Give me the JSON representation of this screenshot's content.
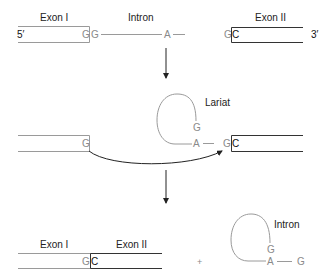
{
  "diagram": {
    "type": "splicing-mechanism",
    "step1": {
      "exon1_label": "Exon I",
      "intron_label": "Intron",
      "exon2_label": "Exon II",
      "five_prime": "5′",
      "three_prime": "3′",
      "exon1_end": "G",
      "intron_start": "G",
      "branch_point": "A",
      "intron_end": "G",
      "exon2_start": "C"
    },
    "step2": {
      "lariat_label": "Lariat",
      "exon1_end": "G",
      "lariat_g": "G",
      "branch_point": "A",
      "intron_end": "G",
      "exon2_start": "C"
    },
    "step3": {
      "exon1_label": "Exon I",
      "exon2_label": "Exon II",
      "exon1_end": "G",
      "exon2_start": "C",
      "plus": "+",
      "intron_label": "Intron",
      "lariat_g": "G",
      "branch_point": "A",
      "tail_g": "G"
    },
    "colors": {
      "exon1_outline": "#9a9a9a",
      "exon2_outline": "#333333",
      "intron": "#9a9a9a",
      "arrow": "#222222"
    }
  }
}
